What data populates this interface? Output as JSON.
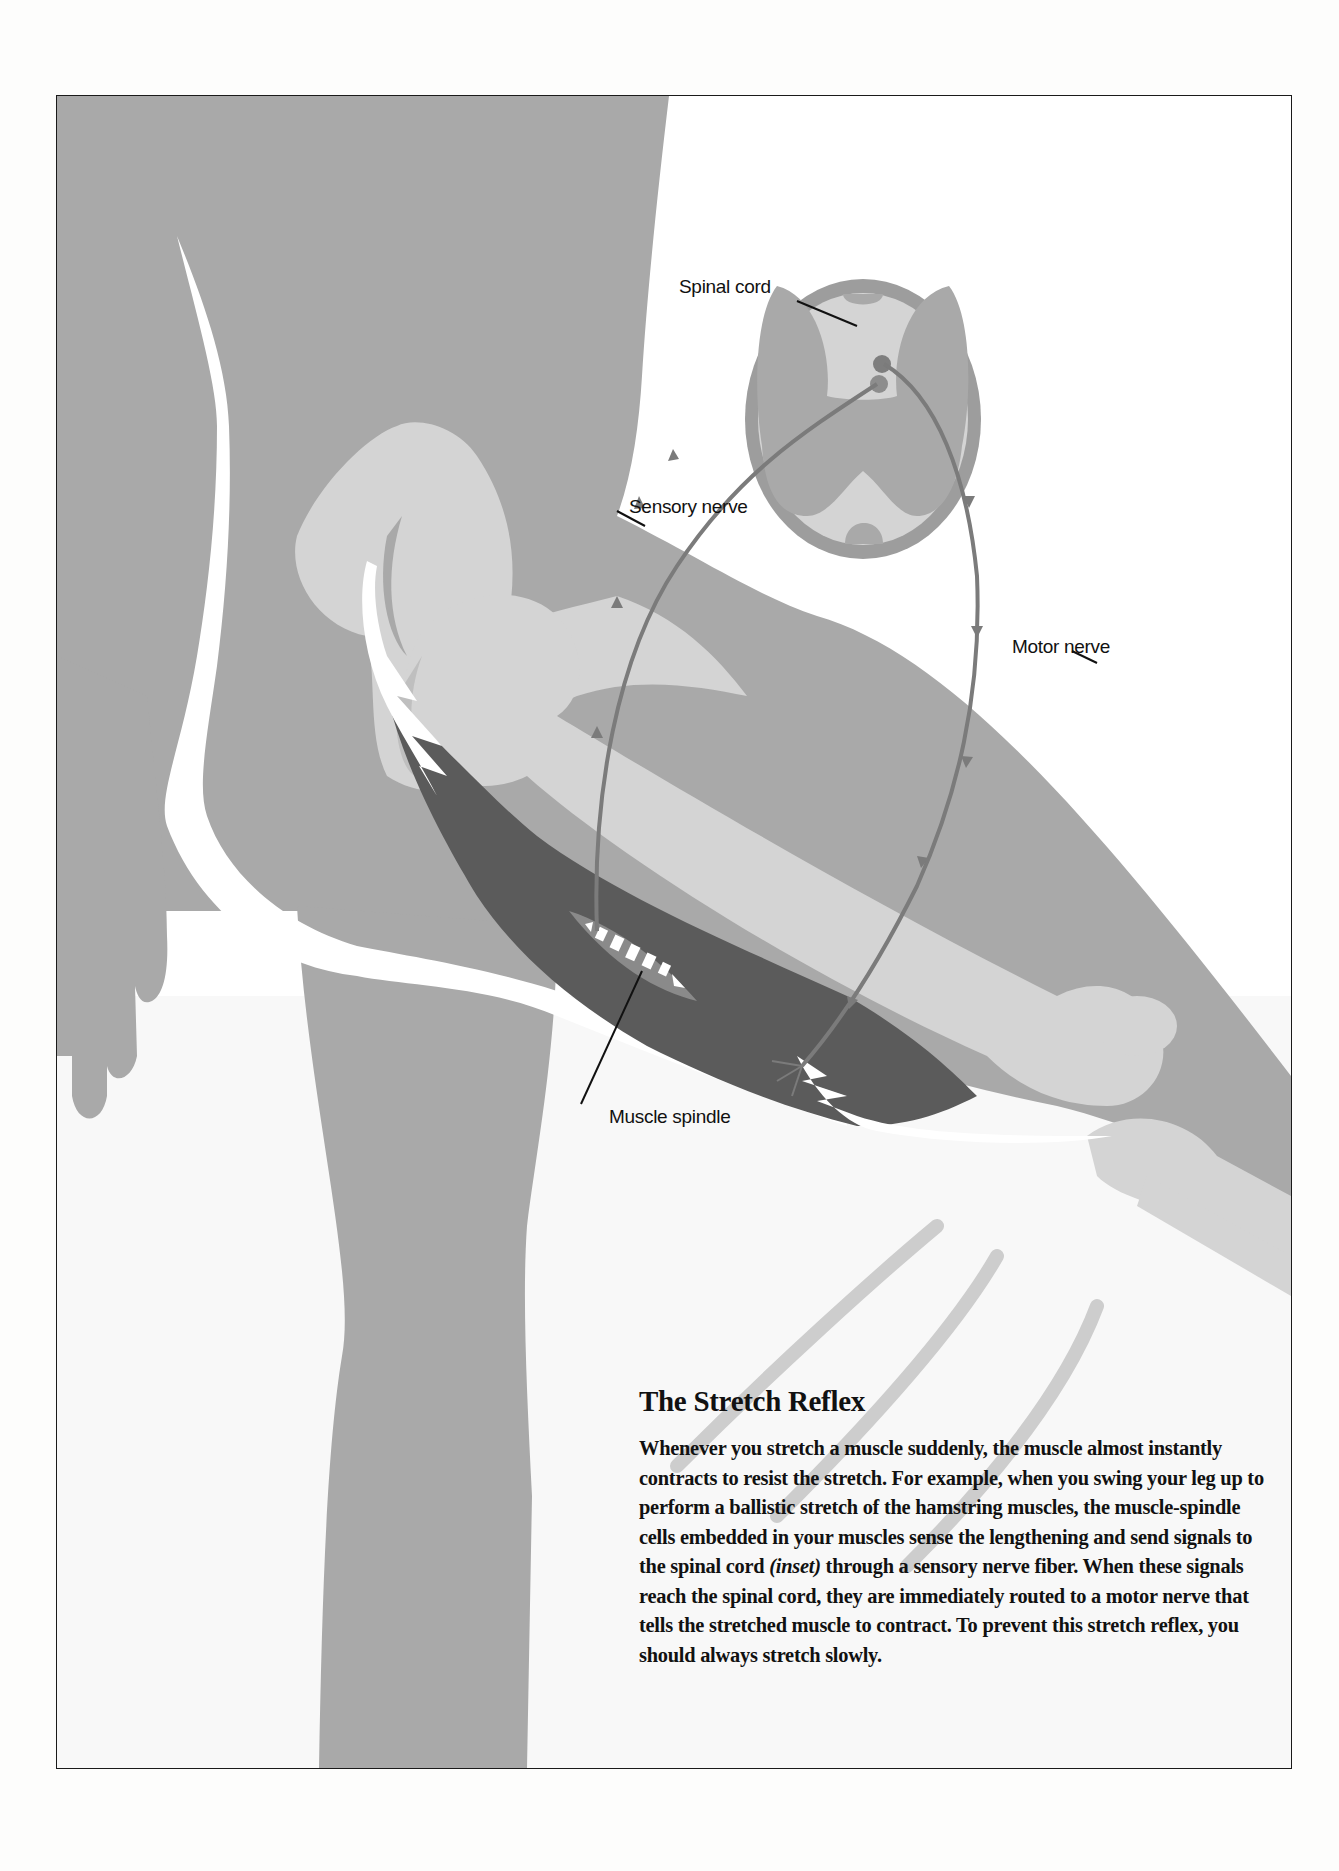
{
  "figure": {
    "labels": {
      "spinal_cord": "Spinal cord",
      "sensory_nerve": "Sensory nerve",
      "motor_nerve": "Motor nerve",
      "muscle_spindle": "Muscle spindle"
    },
    "colors": {
      "body_gray": "#a9a9a9",
      "bone_light": "#d4d4d4",
      "muscle_dark": "#5b5b5b",
      "nerve": "#7b7b7b",
      "tendon_white": "#ffffff",
      "background": "#ffffff"
    }
  },
  "caption": {
    "title": "The Stretch Reflex",
    "body_part1": "Whenever you stretch a muscle suddenly, the muscle almost instantly contracts to resist the stretch. For example, when you swing your leg up to perform a ballistic stretch of the hamstring muscles, the muscle-spindle cells embedded in your muscles sense the lengthening and send signals to the spinal cord ",
    "body_italic": "(inset)",
    "body_part2": " through a sensory nerve fiber. When these signals reach the spinal cord, they are immediately routed to a motor nerve that tells the stretched muscle to contract. To prevent this stretch reflex, you should always stretch slowly."
  }
}
